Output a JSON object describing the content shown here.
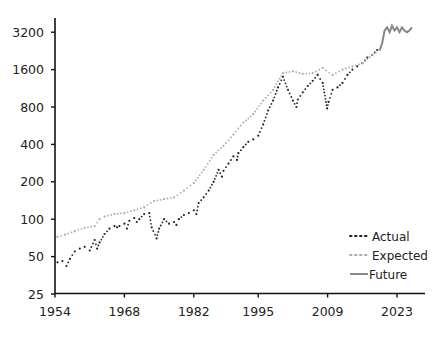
{
  "chart_data": {
    "type": "line",
    "title": "",
    "xlabel": "",
    "ylabel": "",
    "y_scale": "log2",
    "xlim": [
      1954,
      2027
    ],
    "ylim": [
      25,
      4000
    ],
    "x_ticks": [
      1954,
      1968,
      1982,
      1995,
      2009,
      2023
    ],
    "x_tick_labels": [
      "1954",
      "1968",
      "1982",
      "1995",
      "2009",
      "2023"
    ],
    "y_ticks": [
      25,
      50,
      100,
      200,
      400,
      800,
      1600,
      3200
    ],
    "y_tick_labels": [
      "25",
      "50",
      "100",
      "200",
      "400",
      "800",
      "1600",
      "3200"
    ],
    "grid": false,
    "legend": {
      "position": "bottom-right",
      "entries": [
        "Actual",
        "Expected",
        "Future"
      ]
    },
    "series": [
      {
        "name": "Actual",
        "style": "dotted",
        "color": "#222222",
        "x": [
          1954.5,
          1955.5,
          1956.3,
          1957,
          1958,
          1959,
          1960,
          1961,
          1962,
          1962.5,
          1963,
          1964,
          1965,
          1966,
          1966.5,
          1967,
          1968,
          1968.5,
          1969,
          1970,
          1970.5,
          1971,
          1972,
          1973,
          1973.5,
          1974.5,
          1975,
          1976,
          1977,
          1978,
          1978.5,
          1979,
          1980,
          1981,
          1982,
          1982.5,
          1983,
          1984,
          1985,
          1986,
          1987,
          1987.7,
          1988,
          1989,
          1990,
          1990.7,
          1991,
          1992,
          1993,
          1994,
          1995,
          1996,
          1997,
          1998,
          1999,
          2000,
          2001,
          2002,
          2002.7,
          2003,
          2004,
          2005,
          2006,
          2007,
          2008,
          2008.9,
          2009.2,
          2010,
          2011,
          2012,
          2013,
          2014,
          2015,
          2016,
          2017,
          2018,
          2019
        ],
        "y": [
          45,
          46,
          42,
          48,
          55,
          58,
          60,
          56,
          68,
          58,
          65,
          76,
          84,
          88,
          86,
          88,
          92,
          84,
          97,
          102,
          95,
          100,
          110,
          112,
          86,
          70,
          84,
          100,
          92,
          95,
          90,
          100,
          108,
          112,
          118,
          110,
          135,
          150,
          170,
          200,
          250,
          220,
          245,
          280,
          320,
          300,
          340,
          380,
          420,
          440,
          470,
          580,
          750,
          900,
          1150,
          1400,
          1100,
          900,
          800,
          920,
          1050,
          1180,
          1300,
          1450,
          1250,
          780,
          880,
          1100,
          1150,
          1250,
          1450,
          1600,
          1700,
          1800,
          2000,
          2100,
          2300
        ]
      },
      {
        "name": "Expected",
        "style": "dotted",
        "color": "#aaaaaa",
        "x": [
          1954.5,
          1956,
          1958,
          1960,
          1962,
          1963,
          1964,
          1966,
          1968,
          1970,
          1972,
          1974,
          1976,
          1978,
          1980,
          1982,
          1984,
          1986,
          1988,
          1990,
          1992,
          1994,
          1996,
          1998,
          2000,
          2002,
          2004,
          2006,
          2008,
          2010,
          2012,
          2014,
          2016,
          2018,
          2019.5
        ],
        "y": [
          72,
          75,
          80,
          85,
          88,
          100,
          105,
          110,
          112,
          118,
          125,
          140,
          145,
          150,
          170,
          195,
          250,
          330,
          390,
          480,
          600,
          700,
          900,
          1100,
          1500,
          1550,
          1480,
          1500,
          1650,
          1450,
          1600,
          1700,
          1800,
          2100,
          2300
        ]
      },
      {
        "name": "Future",
        "style": "solid",
        "color": "#888888",
        "x": [
          2019.5,
          2020,
          2020.5,
          2021,
          2021.5,
          2022,
          2022.5,
          2023,
          2023.5,
          2024,
          2024.5,
          2025,
          2025.5,
          2026
        ],
        "y": [
          2300,
          2600,
          3300,
          3500,
          3200,
          3600,
          3300,
          3500,
          3200,
          3500,
          3300,
          3200,
          3300,
          3500
        ]
      }
    ]
  }
}
